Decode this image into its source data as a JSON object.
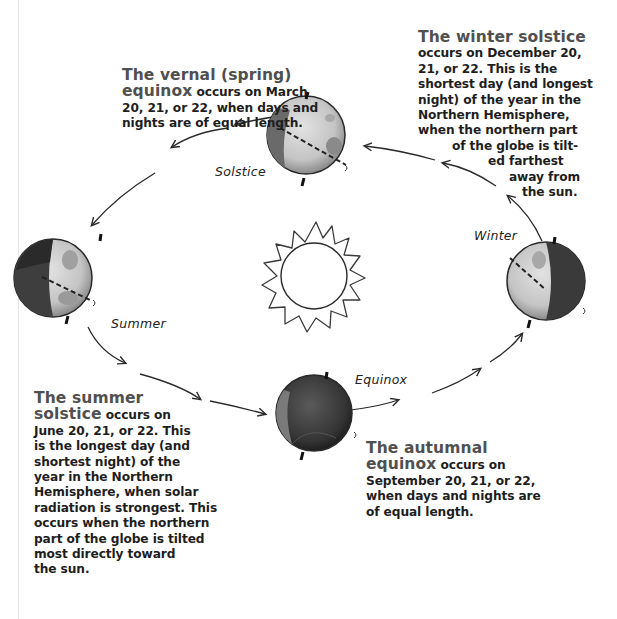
{
  "diagram": {
    "type": "orbit-seasons",
    "center": {
      "name": "sun"
    },
    "globe_labels": {
      "solstice_top": "Solstice",
      "summer": "Summer",
      "winter": "Winter",
      "equinox": "Equinox"
    },
    "blocks": {
      "vernal": {
        "heading_line1": "The vernal (spring)",
        "heading_line2": "equinox",
        "body_line2": " occurs on March",
        "lines": [
          "20, 21, or 22, when days and",
          "nights are of equal length."
        ]
      },
      "winter": {
        "heading": "The winter solstice",
        "lines": [
          "occurs on December 20,",
          "21, or 22. This is the",
          "shortest day (and longest",
          "night) of the year in the",
          "Northern Hemisphere,",
          "when the northern part",
          "of the globe is tilt-",
          "ed farthest",
          "away from",
          "the sun."
        ]
      },
      "summer": {
        "heading_line1": "The summer",
        "heading_line2": "solstice",
        "body_line2": " occurs on",
        "lines": [
          "June 20, 21, or 22. This",
          "is the longest day (and",
          "shortest night) of the",
          "year in the Northern",
          "Hemisphere, when solar",
          "radiation is strongest. This",
          "occurs when the northern",
          "part of the globe is tilted",
          "most directly toward",
          "the sun."
        ]
      },
      "autumnal": {
        "heading_line1": "The autumnal",
        "heading_line2": "equinox",
        "body_line2": " occurs on",
        "lines": [
          "September 20, 21, or 22,",
          "when days and nights are",
          "of equal length."
        ]
      }
    },
    "colors": {
      "heading": "#505050",
      "body": "#1e1e1e",
      "stroke": "#2a2a2a",
      "globe_light": "#c9c9c9",
      "globe_dark": "#3e3e3e"
    }
  }
}
